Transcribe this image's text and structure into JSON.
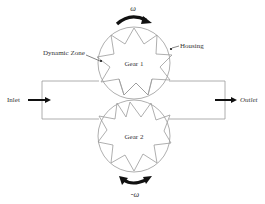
{
  "diagram": {
    "type": "gear-pump-schematic",
    "colors": {
      "outline": "#9a9a9a",
      "arrow": "#111111",
      "text": "#333333",
      "background": "#ffffff"
    },
    "gears": [
      {
        "id": "gear1",
        "label": "Gear 1",
        "cx": 134,
        "cy": 63,
        "r": 36,
        "teeth": 10,
        "rotation_label": "ω"
      },
      {
        "id": "gear2",
        "label": "Gear 2",
        "cx": 134,
        "cy": 136,
        "r": 36,
        "teeth": 10,
        "rotation_label": "-ω"
      }
    ],
    "labels": {
      "dynamic_zone": "Dynamic Zone",
      "housing": "Housing",
      "inlet": "Inlet",
      "outlet": "Outlet",
      "omega_top": "ω",
      "omega_bottom": "-ω",
      "gear1": "Gear 1",
      "gear2": "Gear 2"
    }
  }
}
